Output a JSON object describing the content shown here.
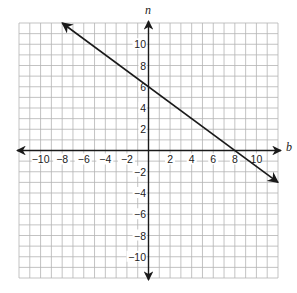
{
  "chart_data": {
    "type": "line",
    "title": "",
    "xlabel": "b",
    "ylabel": "n",
    "xlim": [
      -12,
      12
    ],
    "ylim": [
      -12,
      12
    ],
    "grid": true,
    "legend": null,
    "x_ticks": [
      -10,
      -8,
      -6,
      -4,
      -2,
      2,
      4,
      6,
      8,
      10
    ],
    "y_ticks": [
      -10,
      -8,
      -6,
      -4,
      -2,
      2,
      4,
      6,
      8,
      10
    ],
    "series": [
      {
        "name": "line",
        "equation": "n = -3/4 b + 6",
        "x": [
          -8,
          0,
          8,
          12
        ],
        "y": [
          12,
          6,
          0,
          -3
        ],
        "arrows": "both ends"
      }
    ],
    "key_points": {
      "n_intercept": [
        0,
        6
      ],
      "b_intercept": [
        8,
        0
      ]
    }
  },
  "labels": {
    "x_axis": "b",
    "y_axis": "n"
  },
  "colors": {
    "grid": "#b4b4b4",
    "axis": "#1a1a1a",
    "line": "#1a1a1a",
    "background": "#ffffff"
  }
}
